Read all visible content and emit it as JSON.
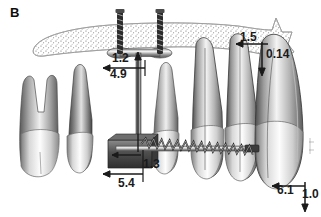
{
  "figure": {
    "panel_label": "B",
    "background_color": "#ffffff",
    "ink_color": "#1a1a1a"
  },
  "dimensions": [
    {
      "id": "d12",
      "value": "1.2",
      "arrow": "left"
    },
    {
      "id": "d49",
      "value": "4.9",
      "arrow": "up"
    },
    {
      "id": "d54",
      "value": "5.4",
      "arrow": "left"
    },
    {
      "id": "d13",
      "value": "1.3",
      "arrow": "left"
    },
    {
      "id": "d15",
      "value": "1.5",
      "arrow": "left"
    },
    {
      "id": "d014",
      "value": "0.14",
      "arrow": "down"
    },
    {
      "id": "d61",
      "value": "6.1",
      "arrow": "left"
    },
    {
      "id": "d10",
      "value": "1.0",
      "arrow": "down"
    }
  ],
  "anatomy": {
    "bone_plate": "alveolar-bone-outline",
    "teeth": [
      {
        "name": "molar",
        "roots": 2
      },
      {
        "name": "premolar-anchor",
        "roots": 1
      },
      {
        "name": "premolar",
        "roots": 1
      },
      {
        "name": "canine",
        "roots": 1
      },
      {
        "name": "lateral-incisor",
        "roots": 1
      },
      {
        "name": "central-incisor",
        "roots": 1
      }
    ],
    "hardware": {
      "miniplate": "bone-anchor-miniplate",
      "screws": 2,
      "coil_spring": "nickel-titanium-coil-spring",
      "archwire": "straight-archwire",
      "bracket": "attachment-bracket"
    }
  }
}
